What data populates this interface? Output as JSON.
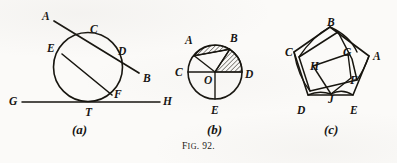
{
  "caption": {
    "prefix": "F",
    "smallcaps": "IG",
    "suffix": ". 92."
  },
  "figures": [
    {
      "id": "a",
      "sublabel": "(a)",
      "description": "Circle with secant line ACDB, chord EF, and tangent line GTH",
      "labels": [
        "A",
        "C",
        "E",
        "D",
        "B",
        "G",
        "F",
        "T",
        "H"
      ]
    },
    {
      "id": "b",
      "sublabel": "(b)",
      "description": "Circle with center O, radii to A, B, C, D, E; hatched segment above chord AB and hatched sector BOD",
      "labels": [
        "A",
        "B",
        "C",
        "O",
        "D",
        "E"
      ]
    },
    {
      "id": "c",
      "sublabel": "(c)",
      "description": "Regular pentagon ABCDE with an inscribed rotated pentagon with vertices F, G, H, J",
      "labels": [
        "B",
        "C",
        "G",
        "A",
        "H",
        "F",
        "J",
        "D",
        "E"
      ]
    }
  ],
  "fig_a": {
    "points": {
      "A": {
        "label": "A",
        "x": 46,
        "y": 16
      },
      "C": {
        "label": "C",
        "x": 94,
        "y": 32
      },
      "E": {
        "label": "E",
        "x": 51,
        "y": 48
      },
      "D": {
        "label": "D",
        "x": 121,
        "y": 51
      },
      "B": {
        "label": "B",
        "x": 146,
        "y": 78
      },
      "G": {
        "label": "G",
        "x": 13,
        "y": 101
      },
      "F": {
        "label": "F",
        "x": 117,
        "y": 94
      },
      "T": {
        "label": "T",
        "x": 89,
        "y": 112
      },
      "H": {
        "label": "H",
        "x": 166,
        "y": 101
      }
    },
    "sublabel": "(a)"
  },
  "fig_b": {
    "points": {
      "A": {
        "label": "A",
        "x": 189,
        "y": 38
      },
      "B": {
        "label": "B",
        "x": 235,
        "y": 36
      },
      "C": {
        "label": "C",
        "x": 182,
        "y": 72
      },
      "O": {
        "label": "O",
        "x": 208,
        "y": 81
      },
      "D": {
        "label": "D",
        "x": 245,
        "y": 76
      },
      "E": {
        "label": "E",
        "x": 213,
        "y": 114
      }
    },
    "sublabel": "(b)"
  },
  "fig_c": {
    "points": {
      "B": {
        "label": "B",
        "x": 331,
        "y": 22
      },
      "C": {
        "label": "C",
        "x": 289,
        "y": 52
      },
      "G": {
        "label": "G",
        "x": 345,
        "y": 52
      },
      "A": {
        "label": "A",
        "x": 375,
        "y": 56
      },
      "H": {
        "label": "H",
        "x": 313,
        "y": 66
      },
      "F": {
        "label": "F",
        "x": 352,
        "y": 80
      },
      "J": {
        "label": "J",
        "x": 331,
        "y": 99
      },
      "D": {
        "label": "D",
        "x": 300,
        "y": 113
      },
      "E": {
        "label": "E",
        "x": 352,
        "y": 113
      }
    },
    "sublabel": "(c)"
  },
  "colors": {
    "ink": "#17150f",
    "paper": "#fbfaf8",
    "hatch": "#2a2720"
  }
}
